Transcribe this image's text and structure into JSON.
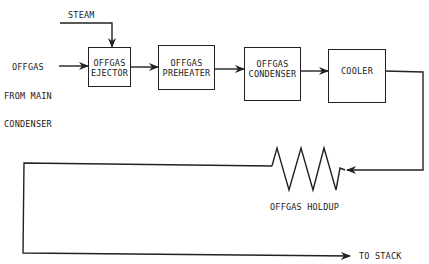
{
  "diagram": {
    "type": "process-flow",
    "inputs": {
      "steam": "STEAM",
      "offgas_source": [
        "OFFGAS",
        "FROM MAIN",
        "CONDENSER"
      ]
    },
    "blocks": [
      {
        "id": "ejector",
        "lines": [
          "OFFGAS",
          "EJECTOR"
        ]
      },
      {
        "id": "preheater",
        "lines": [
          "OFFGAS",
          "PREHEATER"
        ]
      },
      {
        "id": "condenser",
        "lines": [
          "OFFGAS",
          "CONDENSER"
        ]
      },
      {
        "id": "cooler",
        "lines": [
          "COOLER"
        ]
      }
    ],
    "holdup_label": "OFFGAS HOLDUP",
    "output_label": "TO STACK",
    "line_color": "#222222"
  }
}
